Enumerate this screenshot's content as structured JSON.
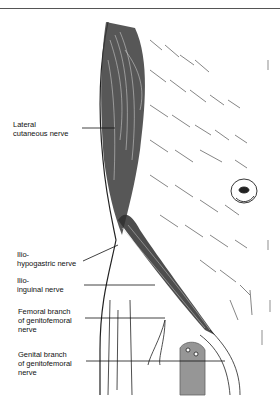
{
  "figure": {
    "type": "anatomical line illustration",
    "labels": [
      {
        "id": "lateral-cutaneous-nerve",
        "lines": [
          "Lateral",
          "cutaneous nerve"
        ]
      },
      {
        "id": "iliohypogastric-nerve",
        "lines": [
          "Ilio-",
          "hypogastric nerve"
        ]
      },
      {
        "id": "ilioinguinal-nerve",
        "lines": [
          "Ilio-",
          "inguinal nerve"
        ]
      },
      {
        "id": "femoral-branch-genitofemoral-nerve",
        "lines": [
          "Femoral branch",
          "of genitofemoral",
          "nerve"
        ]
      },
      {
        "id": "genital-branch-genitofemoral-nerve",
        "lines": [
          "Genital branch",
          "of genitofemoral",
          "nerve"
        ]
      }
    ]
  }
}
